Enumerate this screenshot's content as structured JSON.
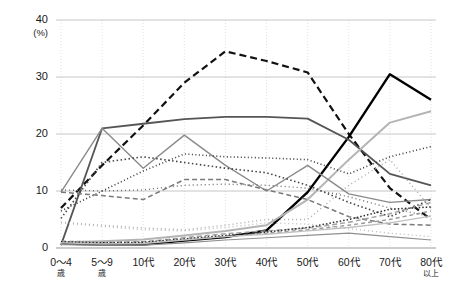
{
  "chart_data": {
    "type": "line",
    "title": "",
    "xlabel": "",
    "ylabel": "",
    "yunit": "(%)",
    "ylim": [
      0,
      40
    ],
    "yticks": [
      0,
      10,
      20,
      30,
      40
    ],
    "grid": true,
    "legend": "none",
    "categories": [
      "0～4歳",
      "5～9歳",
      "10代",
      "20代",
      "30代",
      "40代",
      "50代",
      "60代",
      "70代",
      "80代以上"
    ],
    "category_main": [
      "0～4",
      "5～9",
      "10代",
      "20代",
      "30代",
      "40代",
      "50代",
      "60代",
      "70代",
      "80代"
    ],
    "category_sub": [
      "歳",
      "歳",
      "",
      "",
      "",
      "",
      "",
      "",
      "",
      "以上"
    ],
    "series": [
      {
        "name": "series-01",
        "style": "dashed-heavy",
        "color": "#111111",
        "width": 2.2,
        "dash": "7,4",
        "values": [
          7.0,
          14.5,
          21.5,
          29.0,
          34.5,
          32.8,
          30.8,
          20.0,
          10.5,
          5.0
        ]
      },
      {
        "name": "series-02",
        "style": "solid-heavy",
        "color": "#000000",
        "width": 2.4,
        "dash": "",
        "values": [
          0.8,
          0.6,
          0.6,
          1.3,
          1.9,
          3.1,
          9.8,
          19.5,
          30.5,
          26.0
        ]
      },
      {
        "name": "series-03",
        "style": "solid-dark",
        "color": "#555555",
        "width": 1.8,
        "dash": "",
        "values": [
          0.5,
          21.0,
          21.8,
          22.6,
          23.0,
          23.0,
          22.7,
          19.0,
          13.0,
          11.0
        ]
      },
      {
        "name": "series-04",
        "style": "solid-light",
        "color": "#b4b4b4",
        "width": 2.0,
        "dash": "",
        "values": [
          1.0,
          1.2,
          1.5,
          2.2,
          3.0,
          4.0,
          8.5,
          15.5,
          22.0,
          24.0
        ]
      },
      {
        "name": "series-05",
        "style": "solid-mid",
        "color": "#8a8a8a",
        "width": 1.4,
        "dash": "",
        "values": [
          9.8,
          21.0,
          14.0,
          19.8,
          14.5,
          10.0,
          14.5,
          9.5,
          8.0,
          8.5
        ]
      },
      {
        "name": "series-06",
        "style": "dotted-dark",
        "color": "#3a3a3a",
        "width": 1.6,
        "dash": "1,2.5",
        "values": [
          6.5,
          10.0,
          13.5,
          16.5,
          16.0,
          15.8,
          15.5,
          13.0,
          16.0,
          17.8
        ]
      },
      {
        "name": "series-07",
        "style": "dotted-dark2",
        "color": "#444444",
        "width": 1.6,
        "dash": "1.5,2.5",
        "values": [
          5.2,
          15.0,
          16.0,
          15.0,
          14.0,
          13.2,
          11.0,
          8.0,
          5.5,
          8.5
        ]
      },
      {
        "name": "series-08",
        "style": "dotted-mid",
        "color": "#6e6e6e",
        "width": 1.4,
        "dash": "1,3",
        "values": [
          10.2,
          10.0,
          10.2,
          11.0,
          11.2,
          11.0,
          10.5,
          9.0,
          7.0,
          5.5
        ]
      },
      {
        "name": "series-09",
        "style": "dotted-light",
        "color": "#a8a8a8",
        "width": 1.4,
        "dash": "1,3",
        "values": [
          4.5,
          4.0,
          3.5,
          3.2,
          4.0,
          5.0,
          5.0,
          11.0,
          15.5,
          7.0
        ]
      },
      {
        "name": "series-10",
        "style": "dashed-mid",
        "color": "#7a7a7a",
        "width": 1.5,
        "dash": "5,3",
        "values": [
          9.8,
          9.2,
          8.5,
          12.0,
          12.0,
          10.2,
          8.5,
          5.5,
          4.2,
          4.0
        ]
      },
      {
        "name": "series-11",
        "style": "dashed-light",
        "color": "#a0a0a0",
        "width": 1.5,
        "dash": "5,3",
        "values": [
          1.2,
          1.0,
          1.1,
          1.8,
          2.5,
          3.0,
          3.5,
          4.5,
          6.0,
          8.0
        ]
      },
      {
        "name": "series-12",
        "style": "dashed-light2",
        "color": "#9a9a9a",
        "width": 1.4,
        "dash": "4,3",
        "values": [
          1.0,
          0.8,
          0.9,
          1.5,
          2.0,
          2.6,
          3.2,
          4.0,
          5.0,
          6.5
        ]
      },
      {
        "name": "series-13",
        "style": "dotted-dark3",
        "color": "#2e2e2e",
        "width": 1.5,
        "dash": "1.5,2",
        "values": [
          1.1,
          0.9,
          1.0,
          1.6,
          2.2,
          2.8,
          3.6,
          5.0,
          6.8,
          7.2
        ]
      },
      {
        "name": "series-14",
        "style": "solid-lightgray",
        "color": "#c0c0c0",
        "width": 1.4,
        "dash": "",
        "values": [
          0.9,
          0.7,
          0.8,
          1.4,
          2.0,
          2.4,
          3.0,
          3.6,
          4.4,
          5.6
        ]
      },
      {
        "name": "series-15",
        "style": "dotted-verylight",
        "color": "#bcbcbc",
        "width": 1.4,
        "dash": "1,3",
        "values": [
          4.4,
          3.8,
          3.2,
          3.0,
          3.6,
          4.4,
          4.2,
          3.4,
          2.6,
          2.0
        ]
      },
      {
        "name": "series-16",
        "style": "solid-thin",
        "color": "#909090",
        "width": 1.2,
        "dash": "",
        "values": [
          0.6,
          0.5,
          0.5,
          0.9,
          1.4,
          1.8,
          2.2,
          2.6,
          2.0,
          1.4
        ]
      }
    ]
  }
}
